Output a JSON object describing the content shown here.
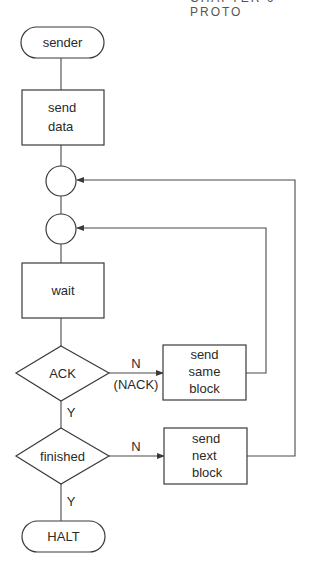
{
  "header": {
    "text": "CHAPTER 6      PROTO"
  },
  "nodes": {
    "start": {
      "label": "sender",
      "shape": "terminator"
    },
    "send_data": {
      "label": "send\ndata",
      "shape": "process"
    },
    "join1": {
      "label": "",
      "shape": "connector"
    },
    "join2": {
      "label": "",
      "shape": "connector"
    },
    "wait": {
      "label": "wait",
      "shape": "process"
    },
    "ack": {
      "label": "ACK",
      "shape": "decision"
    },
    "send_same": {
      "label": "send\nsame\nblock",
      "shape": "process"
    },
    "finished": {
      "label": "finished",
      "shape": "decision"
    },
    "send_next": {
      "label": "send\nnext\nblock",
      "shape": "process"
    },
    "halt": {
      "label": "HALT",
      "shape": "terminator"
    }
  },
  "edges": {
    "ack_no": {
      "label": "N",
      "sublabel": "(NACK)"
    },
    "ack_yes": {
      "label": "Y"
    },
    "finished_no": {
      "label": "N"
    },
    "finished_yes": {
      "label": "Y"
    }
  },
  "colors": {
    "stroke": "#3a3a3a",
    "background": "#ffffff",
    "text": "#2a2a2a"
  }
}
